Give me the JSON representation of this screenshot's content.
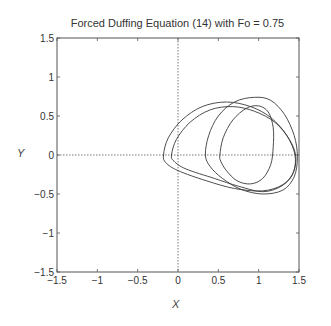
{
  "chart_data": {
    "type": "line",
    "title": "Forced Duffing Equation (14) with Fo = 0.75",
    "xlabel": "X",
    "ylabel": "Y",
    "xlim": [
      -1.5,
      1.5
    ],
    "ylim": [
      -1.5,
      1.5
    ],
    "xticks": [
      "-1.5",
      "-1",
      "-0.5",
      "0",
      "0.5",
      "1",
      "1.5"
    ],
    "yticks": [
      "-1.5",
      "-1",
      "-0.5",
      "0",
      "0.5",
      "1",
      "1.5"
    ],
    "grid": false,
    "legend": null,
    "reference_lines": [
      {
        "orientation": "vertical",
        "value": 0,
        "style": "dotted"
      },
      {
        "orientation": "horizontal",
        "value": 0,
        "style": "dotted"
      }
    ],
    "series": [
      {
        "name": "orbit-loop-1",
        "points": [
          [
            -0.18,
            0.0
          ],
          [
            -0.12,
            0.22
          ],
          [
            0.05,
            0.45
          ],
          [
            0.3,
            0.62
          ],
          [
            0.6,
            0.68
          ],
          [
            0.9,
            0.62
          ],
          [
            1.15,
            0.48
          ],
          [
            1.35,
            0.25
          ],
          [
            1.45,
            0.0
          ],
          [
            1.43,
            -0.22
          ],
          [
            1.3,
            -0.38
          ],
          [
            1.05,
            -0.46
          ],
          [
            0.7,
            -0.43
          ],
          [
            0.35,
            -0.33
          ],
          [
            0.0,
            -0.2
          ],
          [
            -0.15,
            -0.1
          ],
          [
            -0.18,
            0.0
          ]
        ]
      },
      {
        "name": "orbit-loop-2",
        "points": [
          [
            -0.08,
            0.0
          ],
          [
            -0.02,
            0.2
          ],
          [
            0.15,
            0.42
          ],
          [
            0.4,
            0.58
          ],
          [
            0.68,
            0.62
          ],
          [
            0.95,
            0.56
          ],
          [
            1.2,
            0.42
          ],
          [
            1.38,
            0.2
          ],
          [
            1.46,
            -0.02
          ],
          [
            1.42,
            -0.25
          ],
          [
            1.28,
            -0.4
          ],
          [
            1.05,
            -0.47
          ],
          [
            0.75,
            -0.4
          ],
          [
            0.45,
            -0.3
          ],
          [
            0.1,
            -0.18
          ],
          [
            -0.05,
            -0.08
          ],
          [
            -0.08,
            0.0
          ]
        ]
      },
      {
        "name": "orbit-loop-3",
        "points": [
          [
            0.34,
            0.0
          ],
          [
            0.38,
            0.25
          ],
          [
            0.5,
            0.5
          ],
          [
            0.7,
            0.68
          ],
          [
            0.95,
            0.74
          ],
          [
            1.15,
            0.7
          ],
          [
            1.32,
            0.52
          ],
          [
            1.44,
            0.25
          ],
          [
            1.48,
            -0.02
          ],
          [
            1.44,
            -0.28
          ],
          [
            1.3,
            -0.45
          ],
          [
            1.05,
            -0.5
          ],
          [
            0.78,
            -0.44
          ],
          [
            0.55,
            -0.3
          ],
          [
            0.4,
            -0.15
          ],
          [
            0.34,
            0.0
          ]
        ]
      },
      {
        "name": "orbit-loop-4",
        "points": [
          [
            0.52,
            0.0
          ],
          [
            0.56,
            0.22
          ],
          [
            0.68,
            0.45
          ],
          [
            0.85,
            0.6
          ],
          [
            1.0,
            0.63
          ],
          [
            1.12,
            0.55
          ],
          [
            1.18,
            0.35
          ],
          [
            1.18,
            0.1
          ],
          [
            1.15,
            -0.12
          ],
          [
            1.05,
            -0.3
          ],
          [
            0.9,
            -0.37
          ],
          [
            0.73,
            -0.33
          ],
          [
            0.6,
            -0.2
          ],
          [
            0.53,
            -0.08
          ],
          [
            0.52,
            0.0
          ]
        ]
      }
    ]
  },
  "colors": {
    "line": "#3a3a3a",
    "axis": "#555555"
  }
}
